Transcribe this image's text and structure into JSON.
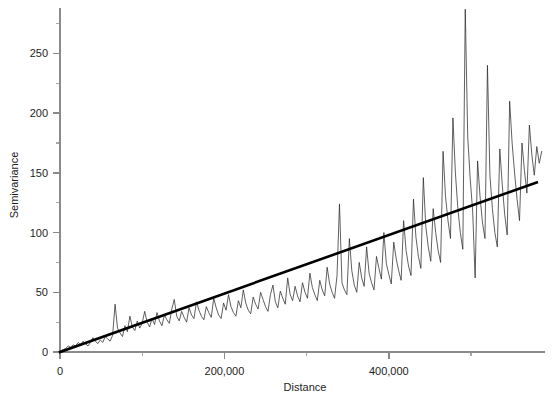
{
  "figure": {
    "background": "#ffffff",
    "line_color": "#2b2b2b",
    "trend_color": "#000000",
    "axis_color": "#8a8a8a"
  },
  "chart_data": {
    "type": "line",
    "title": "",
    "xlabel": "Distance",
    "ylabel": "Semivariance",
    "xlim": [
      0,
      590000
    ],
    "ylim": [
      0,
      288
    ],
    "grid": false,
    "legend": null,
    "xticks": [
      0,
      200000,
      400000
    ],
    "xtick_labels": [
      "0",
      "200,000",
      "400,000"
    ],
    "xticks_minor": [
      100000,
      300000,
      500000
    ],
    "yticks": [
      0,
      50,
      100,
      150,
      200,
      250
    ],
    "ytick_labels": [
      "0",
      "50",
      "100",
      "150",
      "200",
      "250"
    ],
    "yticks_minor": [
      25,
      75,
      125,
      175,
      225,
      275
    ],
    "series": [
      {
        "name": "Empirical semivariogram",
        "color": "#2b2b2b",
        "x": [
          1000,
          4000,
          7000,
          10000,
          13000,
          16000,
          19000,
          22000,
          25000,
          28000,
          31000,
          34000,
          37000,
          40000,
          43000,
          46000,
          49000,
          52000,
          55000,
          58000,
          61000,
          64000,
          67000,
          70000,
          73000,
          76000,
          79000,
          82000,
          85000,
          88000,
          91000,
          94000,
          97000,
          100000,
          103000,
          106000,
          109000,
          112000,
          115000,
          118000,
          121000,
          124000,
          127000,
          130000,
          133000,
          136000,
          139000,
          142000,
          145000,
          148000,
          151000,
          154000,
          157000,
          160000,
          163000,
          166000,
          169000,
          172000,
          175000,
          178000,
          181000,
          184000,
          187000,
          190000,
          193000,
          196000,
          199000,
          202000,
          205000,
          208000,
          211000,
          214000,
          217000,
          220000,
          223000,
          226000,
          229000,
          232000,
          235000,
          238000,
          241000,
          244000,
          247000,
          250000,
          253000,
          256000,
          259000,
          262000,
          265000,
          268000,
          271000,
          274000,
          277000,
          280000,
          283000,
          286000,
          289000,
          292000,
          295000,
          298000,
          301000,
          304000,
          307000,
          310000,
          313000,
          316000,
          319000,
          322000,
          325000,
          328000,
          331000,
          334000,
          337000,
          340000,
          343000,
          346000,
          349000,
          352000,
          355000,
          358000,
          361000,
          364000,
          367000,
          370000,
          373000,
          376000,
          379000,
          382000,
          385000,
          388000,
          391000,
          394000,
          397000,
          400000,
          403000,
          406000,
          409000,
          412000,
          415000,
          418000,
          421000,
          424000,
          427000,
          430000,
          433000,
          436000,
          439000,
          442000,
          445000,
          448000,
          451000,
          454000,
          457000,
          460000,
          463000,
          466000,
          469000,
          472000,
          475000,
          478000,
          481000,
          484000,
          487000,
          490000,
          493000,
          496000,
          499000,
          502000,
          505000,
          508000,
          511000,
          514000,
          517000,
          520000,
          523000,
          526000,
          529000,
          532000,
          535000,
          538000,
          541000,
          544000,
          547000,
          550000,
          553000,
          556000,
          559000,
          562000,
          565000,
          568000,
          571000,
          574000,
          577000,
          580000,
          583000,
          586000
        ],
        "y": [
          1,
          2,
          3,
          5,
          4,
          6,
          5,
          8,
          6,
          9,
          7,
          5,
          8,
          12,
          9,
          7,
          10,
          8,
          13,
          11,
          9,
          14,
          40,
          20,
          16,
          13,
          22,
          17,
          30,
          21,
          18,
          26,
          20,
          24,
          34,
          25,
          21,
          28,
          23,
          33,
          26,
          22,
          31,
          27,
          24,
          36,
          44,
          30,
          26,
          34,
          29,
          25,
          37,
          31,
          28,
          42,
          35,
          30,
          27,
          38,
          33,
          29,
          45,
          37,
          31,
          28,
          41,
          35,
          48,
          38,
          33,
          30,
          43,
          37,
          52,
          41,
          35,
          32,
          46,
          40,
          36,
          50,
          44,
          38,
          34,
          48,
          56,
          42,
          37,
          51,
          45,
          40,
          62,
          48,
          43,
          55,
          47,
          42,
          58,
          50,
          45,
          66,
          54,
          48,
          43,
          60,
          52,
          47,
          71,
          57,
          50,
          45,
          64,
          124,
          58,
          52,
          48,
          95,
          68,
          56,
          50,
          75,
          62,
          55,
          88,
          66,
          58,
          52,
          80,
          70,
          61,
          100,
          74,
          65,
          57,
          92,
          78,
          68,
          60,
          110,
          85,
          72,
          64,
          128,
          96,
          80,
          70,
          146,
          105,
          88,
          76,
          120,
          100,
          85,
          75,
          168,
          130,
          110,
          95,
          196,
          150,
          120,
          100,
          86,
          287,
          180,
          145,
          118,
          62,
          160,
          130,
          108,
          95,
          240,
          148,
          120,
          100,
          88,
          170,
          140,
          115,
          98,
          210,
          175,
          150,
          128,
          110,
          175,
          152,
          133,
          190,
          165,
          148,
          172,
          158,
          168
        ]
      },
      {
        "name": "Fitted trend line",
        "color": "#000000",
        "type": "trend",
        "x": [
          0,
          580000
        ],
        "y": [
          0,
          142
        ]
      }
    ]
  },
  "labels": {
    "y_axis_title": "Semivariance",
    "x_axis_title": "Distance"
  }
}
